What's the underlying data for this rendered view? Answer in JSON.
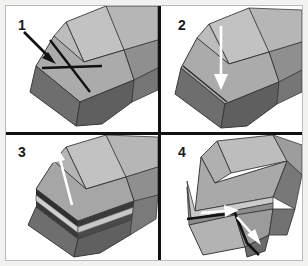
{
  "figure": {
    "type": "four-panel-sequence-diagram",
    "panel_count": 4,
    "background_color": "#ffffff",
    "border_color": "#b9b9b9",
    "divider_color": "#111111",
    "palette": {
      "face_top_light": "#c2c2c2",
      "face_top_mid": "#a8a8a8",
      "face_front_mid": "#9a9a9a",
      "face_side_dark": "#6e6e6e",
      "face_side_darker": "#5c5c5c",
      "edge_line": "#3a3a3a",
      "arrow_black": "#111111",
      "arrow_white": "#ffffff"
    }
  },
  "panels": [
    {
      "number": "1",
      "name": "panel-1",
      "annotation_color": "#111111",
      "marks": [
        "down-right-arrow",
        "crossing-line-a",
        "crossing-line-b"
      ]
    },
    {
      "number": "2",
      "name": "panel-2",
      "annotation_color": "#ffffff",
      "marks": [
        "down-arrow"
      ]
    },
    {
      "number": "3",
      "name": "panel-3",
      "annotation_color": "#ffffff",
      "marks": [
        "up-arrow"
      ]
    },
    {
      "number": "4",
      "name": "panel-4",
      "annotation_color": "#ffffff",
      "marks": [
        "right-arrow",
        "down-right-arrow",
        "black-fold-line"
      ]
    }
  ]
}
